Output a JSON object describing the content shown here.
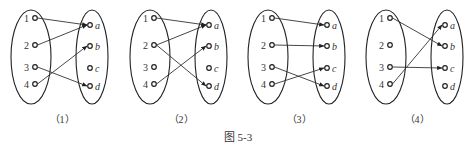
{
  "figure_caption": "图 5-3",
  "domain_labels": [
    "1",
    "2",
    "3",
    "4"
  ],
  "codomain_labels": [
    "a",
    "b",
    "c",
    "d"
  ],
  "colors": {
    "stroke": "#222222",
    "background": "#ffffff"
  },
  "diagrams": [
    {
      "caption": "（1）",
      "mappings": [
        [
          "1",
          "a"
        ],
        [
          "2",
          "a"
        ],
        [
          "3",
          "d"
        ],
        [
          "4",
          "b"
        ]
      ]
    },
    {
      "caption": "（2）",
      "mappings": [
        [
          "1",
          "a"
        ],
        [
          "2",
          "a"
        ],
        [
          "2",
          "d"
        ],
        [
          "4",
          "b"
        ]
      ]
    },
    {
      "caption": "（3）",
      "mappings": [
        [
          "1",
          "a"
        ],
        [
          "2",
          "b"
        ],
        [
          "3",
          "d"
        ],
        [
          "4",
          "c"
        ]
      ]
    },
    {
      "caption": "（4）",
      "mappings": [
        [
          "1",
          "b"
        ],
        [
          "3",
          "c"
        ],
        [
          "4",
          "a"
        ]
      ]
    }
  ]
}
